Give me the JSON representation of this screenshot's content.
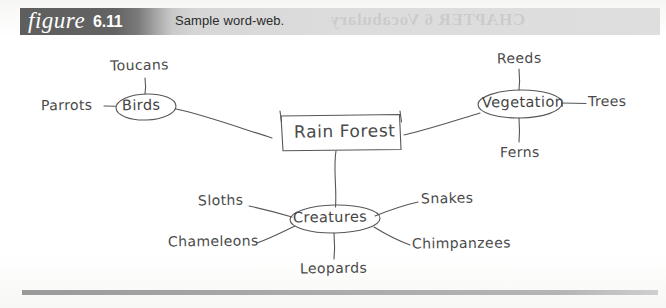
{
  "header": {
    "figure_word": "figure",
    "figure_number": "6.11",
    "caption": "Sample word-web.",
    "bleed_through_text": "CHAPTER 6  Vocabulary"
  },
  "diagram": {
    "type": "word-web",
    "center_node": {
      "label": "Rain Forest",
      "shape": "rectangle"
    },
    "branches": [
      {
        "node": "Birds",
        "shape": "ellipse",
        "leaves": [
          "Toucans",
          "Parrots"
        ]
      },
      {
        "node": "Vegetation",
        "shape": "ellipse",
        "leaves": [
          "Reeds",
          "Trees",
          "Ferns"
        ]
      },
      {
        "node": "Creatures",
        "shape": "ellipse",
        "leaves": [
          "Sloths",
          "Snakes",
          "Chameleons",
          "Chimpanzees",
          "Leopards"
        ]
      }
    ],
    "labels": {
      "toucans": "Toucans",
      "parrots": "Parrots",
      "birds": "Birds",
      "rain_forest": "Rain Forest",
      "reeds": "Reeds",
      "vegetation": "Vegetation",
      "trees": "Trees",
      "ferns": "Ferns",
      "sloths": "Sloths",
      "snakes": "Snakes",
      "creatures": "Creatures",
      "chameleons": "Chameleons",
      "chimpanzees": "Chimpanzees",
      "leopards": "Leopards"
    }
  },
  "colors": {
    "band_dark": "#5e5e5e",
    "band_light": "#dedede",
    "ink": "#4a4a4a",
    "caption_text": "#2b2b2b",
    "rule": "#a8a8a8"
  }
}
